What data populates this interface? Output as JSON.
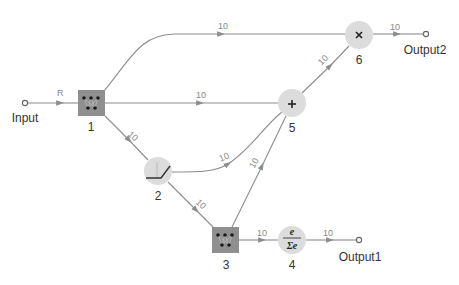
{
  "diagram": {
    "type": "neural-network-graph",
    "colors": {
      "edge": "#8c8c8c",
      "node_fill": "#dcdcdc",
      "box_fill": "#8f8f8f",
      "text": "#333333",
      "weight_text": "#8a8a8a"
    },
    "ports": [
      {
        "id": "input",
        "label": "Input"
      },
      {
        "id": "output1",
        "label": "Output1"
      },
      {
        "id": "output2",
        "label": "Output2"
      }
    ],
    "nodes": [
      {
        "id": "1",
        "label": "1",
        "kind": "weights-layer",
        "icon": "weights-icon"
      },
      {
        "id": "2",
        "label": "2",
        "kind": "ramp-activation",
        "icon": "ramp-icon"
      },
      {
        "id": "3",
        "label": "3",
        "kind": "weights-layer",
        "icon": "weights-icon"
      },
      {
        "id": "4",
        "label": "4",
        "kind": "softmax",
        "icon": "softmax-icon",
        "numerator": "e",
        "denominator": "Σe"
      },
      {
        "id": "5",
        "label": "5",
        "kind": "addition",
        "icon": "plus-icon",
        "symbol": "+"
      },
      {
        "id": "6",
        "label": "6",
        "kind": "multiplication",
        "icon": "times-icon",
        "symbol": "×"
      }
    ],
    "edges": [
      {
        "from": "input",
        "to": "1",
        "label": "R"
      },
      {
        "from": "1",
        "to": "6",
        "label": "10"
      },
      {
        "from": "1",
        "to": "5",
        "label": "10"
      },
      {
        "from": "1",
        "to": "2",
        "label": "10"
      },
      {
        "from": "2",
        "to": "5",
        "label": "10"
      },
      {
        "from": "2",
        "to": "3",
        "label": "10"
      },
      {
        "from": "3",
        "to": "5",
        "label": "10"
      },
      {
        "from": "3",
        "to": "4",
        "label": "10"
      },
      {
        "from": "4",
        "to": "output1",
        "label": "10"
      },
      {
        "from": "5",
        "to": "6",
        "label": "10"
      },
      {
        "from": "6",
        "to": "output2",
        "label": "10"
      }
    ]
  }
}
